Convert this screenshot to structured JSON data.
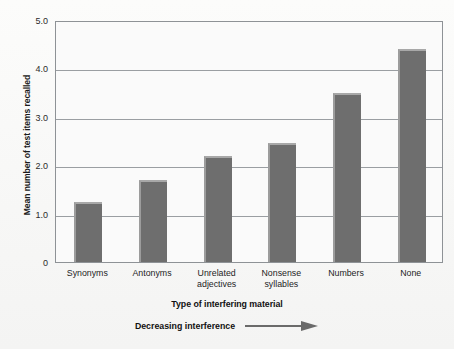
{
  "chart_data": {
    "type": "bar",
    "title": "",
    "categories": [
      "Synonyms",
      "Antonyms",
      "Unrelated adjectives",
      "Nonsense syllables",
      "Numbers",
      "None"
    ],
    "category_lines": [
      [
        "Synonyms"
      ],
      [
        "Antonyms"
      ],
      [
        "Unrelated",
        "adjectives"
      ],
      [
        "Nonsense",
        "syllables"
      ],
      [
        "Numbers"
      ],
      [
        "None"
      ]
    ],
    "values": [
      1.25,
      1.7,
      2.2,
      2.45,
      3.5,
      4.4
    ],
    "xlabel": "Type of interfering material",
    "ylabel": "Mean number of test items recalled",
    "ylim": [
      0,
      5.0
    ],
    "yticks": [
      0,
      1.0,
      2.0,
      3.0,
      4.0,
      5.0
    ],
    "ytick_labels": [
      "0",
      "1.0",
      "2.0",
      "3.0",
      "4.0",
      "5.0"
    ],
    "grid": true,
    "legend": "none",
    "bar_color": "#6e6e6e",
    "bar_highlight_color": "#a8a8a8",
    "plot_border_color": "#8e9296",
    "gridline_color": "#9a9ea2",
    "background_color": "#fafafa",
    "annotation": "Decreasing interference",
    "annotation_arrow": "right-arrow"
  }
}
